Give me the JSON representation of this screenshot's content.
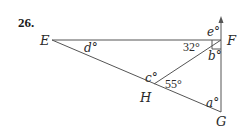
{
  "problem": {
    "number": "26."
  },
  "points": {
    "E": {
      "label": "E"
    },
    "F": {
      "label": "F"
    },
    "G": {
      "label": "G"
    },
    "H": {
      "label": "H"
    }
  },
  "angles": {
    "a": "a°",
    "b": "b°",
    "c": "c°",
    "d": "d°",
    "e": "e°",
    "angle_EFH": "32°",
    "angle_FHG": "55°"
  },
  "colors": {
    "line": "#555555",
    "text": "#2a2a2a"
  }
}
